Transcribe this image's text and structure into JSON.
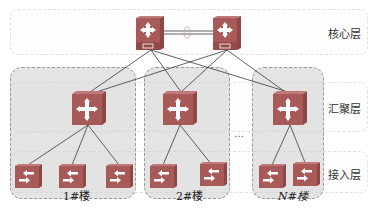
{
  "layers": [
    {
      "id": "core",
      "label": "核心层"
    },
    {
      "id": "aggregation",
      "label": "汇聚层"
    },
    {
      "id": "access",
      "label": "接入层"
    }
  ],
  "buildings": [
    {
      "label": "1#楼",
      "access_switches": 3
    },
    {
      "label": "2#楼",
      "access_switches": 2
    },
    {
      "label": "N#楼",
      "access_switches": 2
    }
  ],
  "ellipsis": "…",
  "core_switches": [
    {
      "name": "core-switch-1",
      "tag": "C1"
    },
    {
      "name": "core-switch-2",
      "tag": "C2"
    }
  ],
  "colors": {
    "device_face": "#a85a58",
    "device_side": "#8d4846",
    "building_fill": "#d0d0d0",
    "line": "#333333"
  }
}
